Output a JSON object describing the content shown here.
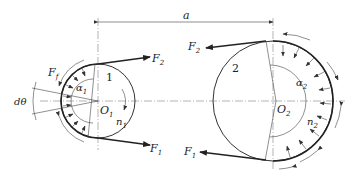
{
  "diagram": {
    "type": "belt-drive-force-analysis",
    "dimension_label": "a",
    "pulley_small": {
      "number_label": "1",
      "center_label": "O",
      "center_sub": "1",
      "speed_label": "n",
      "speed_sub": "1",
      "wrap_angle_label": "α",
      "wrap_angle_sub": "1"
    },
    "pulley_large": {
      "number_label": "2",
      "center_label": "O",
      "center_sub": "2",
      "speed_label": "n",
      "speed_sub": "2",
      "wrap_angle_label": "α",
      "wrap_angle_sub": "2"
    },
    "forces": {
      "tight_left": {
        "label": "F",
        "sub": "2"
      },
      "slack_left": {
        "label": "F",
        "sub": "1"
      },
      "tight_right": {
        "label": "F",
        "sub": "2"
      },
      "slack_right": {
        "label": "F",
        "sub": "1"
      },
      "friction_left": {
        "label": "F",
        "sub": "f"
      }
    },
    "element_angle_label": "dθ",
    "colors": {
      "line": "#222222",
      "background": "#ffffff"
    }
  }
}
